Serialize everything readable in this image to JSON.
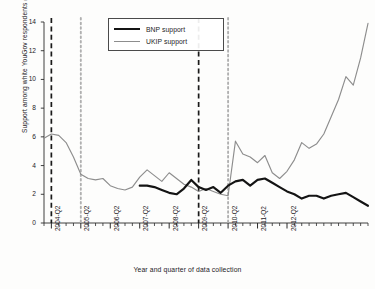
{
  "chart_data": {
    "type": "line",
    "title": "",
    "xlabel": "Year  and quarter of data collection",
    "ylabel": "Support among white YouGov respondents (%)",
    "ylim": [
      0,
      14
    ],
    "yticks": [
      0,
      2,
      4,
      6,
      8,
      10,
      12,
      14
    ],
    "xlim": [
      0,
      35
    ],
    "grid": false,
    "legend_position": "top-left-inside",
    "xtick_labels": [
      "2004-Q2",
      "2005-Q2",
      "2006-Q2",
      "2007-Q2",
      "2008-Q2",
      "2009-Q2",
      "2010-Q2",
      "2011-Q2",
      "2012-Q2"
    ],
    "xtick_indices": [
      1,
      5,
      9,
      13,
      17,
      21,
      25,
      29,
      33
    ],
    "x": [
      0,
      1,
      2,
      3,
      4,
      5,
      6,
      7,
      8,
      9,
      10,
      11,
      12,
      13,
      14,
      15,
      16,
      17,
      18,
      19,
      20,
      21,
      22,
      23,
      24,
      25,
      26,
      27,
      28,
      29,
      30,
      31,
      32,
      33,
      34,
      35
    ],
    "series": [
      {
        "name": "UKIP support",
        "color": "#8d8d8d",
        "width": 1.1,
        "values": [
          5.9,
          6.2,
          6.1,
          5.6,
          4.6,
          3.4,
          3.1,
          3.0,
          3.1,
          2.6,
          2.4,
          2.3,
          2.5,
          3.2,
          3.7,
          3.3,
          2.9,
          3.5,
          3.1,
          2.7,
          2.5,
          2.2,
          2.4,
          2.2,
          2.0,
          1.9,
          5.7,
          4.8,
          4.6,
          4.2,
          4.7,
          3.5,
          3.1,
          3.3,
          3.8,
          4.4
        ]
      },
      {
        "name": "BNP support",
        "color": "#141414",
        "width": 2.1,
        "values": [
          null,
          null,
          null,
          null,
          null,
          null,
          null,
          null,
          null,
          null,
          null,
          null,
          null,
          2.6,
          2.6,
          2.5,
          2.3,
          2.1,
          2.0,
          2.4,
          3.0,
          2.5,
          2.3,
          2.5,
          2.1,
          2.6,
          2.9,
          3.0,
          2.6,
          3.0,
          3.1,
          2.8,
          2.5,
          2.2,
          2.0,
          1.7
        ]
      }
    ],
    "series_continued": [
      {
        "name": "UKIP support",
        "tail_x": [
          26,
          27,
          28,
          29,
          30,
          31,
          32,
          33,
          34,
          35
        ],
        "tail_values": [
          5.7,
          4.8,
          4.6,
          4.2,
          4.7,
          3.5,
          3.1,
          3.3,
          3.8,
          4.4
        ]
      }
    ],
    "ukip_full": [
      5.9,
      6.2,
      6.1,
      5.6,
      4.6,
      3.4,
      3.1,
      3.0,
      3.1,
      2.6,
      2.4,
      2.3,
      2.5,
      3.2,
      3.7,
      3.3,
      2.9,
      3.5,
      3.1,
      2.7,
      2.5,
      2.2,
      2.4,
      2.2,
      2.0,
      1.9,
      5.7,
      4.8,
      4.6,
      4.2,
      4.7,
      3.5,
      3.1,
      3.6,
      4.4,
      5.6,
      5.2,
      5.5,
      6.2,
      7.4,
      8.6,
      10.2,
      9.6,
      11.5,
      13.9
    ],
    "bnp_full": [
      null,
      null,
      null,
      null,
      null,
      null,
      null,
      null,
      null,
      null,
      null,
      null,
      null,
      2.6,
      2.6,
      2.5,
      2.3,
      2.1,
      2.0,
      2.4,
      3.0,
      2.5,
      2.3,
      2.5,
      2.1,
      2.6,
      2.9,
      3.0,
      2.6,
      3.0,
      3.1,
      2.8,
      2.5,
      2.2,
      2.0,
      1.7,
      1.9,
      1.9,
      1.7,
      1.9,
      2.0,
      2.1,
      1.8,
      1.5,
      1.2
    ],
    "n_points": 45,
    "annotations": {
      "vertical_lines": [
        {
          "name": "election-line-2004",
          "x_index": 1,
          "style": "dashed",
          "color": "#1a1a1a"
        },
        {
          "name": "election-line-2005",
          "x_index": 5,
          "style": "dotted",
          "color": "#b0b0b0"
        },
        {
          "name": "election-line-2009",
          "x_index": 21,
          "style": "dashed",
          "color": "#1a1a1a"
        },
        {
          "name": "election-line-2010",
          "x_index": 25,
          "style": "dotted",
          "color": "#b0b0b0"
        }
      ]
    }
  },
  "legend": {
    "items": [
      {
        "label": "BNP support",
        "key": "bnp"
      },
      {
        "label": "UKIP support",
        "key": "ukip"
      }
    ]
  },
  "axes": {
    "y_title": "Support among white YouGov respondents (%)",
    "x_title": "Year  and quarter of data collection",
    "y_ticks": [
      "0",
      "2",
      "4",
      "6",
      "8",
      "10",
      "12",
      "14"
    ],
    "x_ticks": [
      "2004-Q2",
      "2005-Q2",
      "2006-Q2",
      "2007-Q2",
      "2008-Q2",
      "2009-Q2",
      "2010-Q2",
      "2011-Q2",
      "2012-Q2"
    ]
  }
}
